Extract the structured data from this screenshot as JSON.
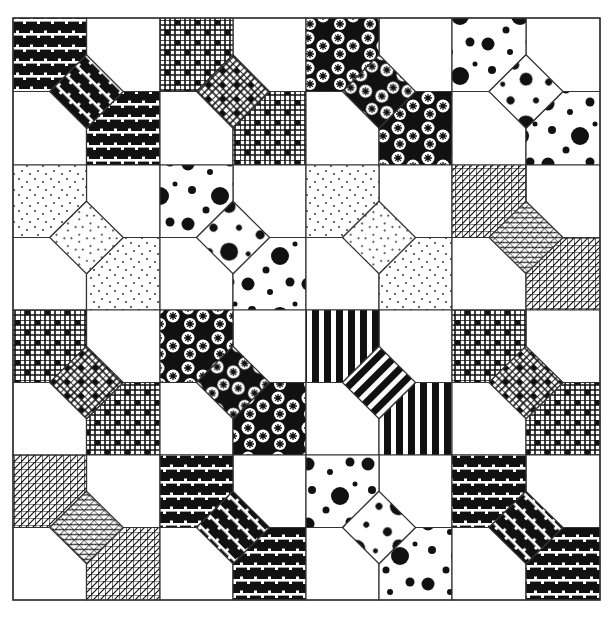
{
  "figure": {
    "title": "",
    "grid": {
      "rows": 4,
      "cols": 4,
      "origin_x": 13,
      "origin_y": 18,
      "block_size": 146.75
    },
    "colors": {
      "ink": "#111111",
      "paper": "#ffffff",
      "line": "#333333"
    },
    "pattern_names": [
      "brick-stripes",
      "check-grid",
      "star-circles",
      "big-dots",
      "stipple",
      "crosshatch",
      "vertical-stripes"
    ],
    "blocks": [
      [
        "brick-stripes",
        "check-grid",
        "star-circles",
        "big-dots"
      ],
      [
        "stipple",
        "big-dots",
        "stipple",
        "crosshatch"
      ],
      [
        "check-grid",
        "star-circles",
        "vertical-stripes",
        "check-grid"
      ],
      [
        "crosshatch",
        "brick-stripes",
        "big-dots",
        "brick-stripes"
      ]
    ]
  }
}
